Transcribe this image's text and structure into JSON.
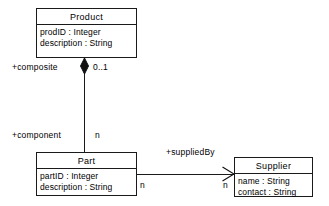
{
  "diagram": {
    "type": "uml-class-diagram",
    "background_color": "#ffffff",
    "line_color": "#1a1a1a"
  },
  "classes": [
    {
      "id": "product",
      "name": "Product",
      "attributes": [
        "prodID : Integer",
        "description : String"
      ]
    },
    {
      "id": "part",
      "name": "Part",
      "attributes": [
        "partID : Integer",
        "description : String"
      ]
    },
    {
      "id": "supplier",
      "name": "Supplier",
      "attributes": [
        "name : String",
        "contact : String"
      ]
    }
  ],
  "relationships": [
    {
      "id": "composition",
      "kind": "composition",
      "from": "Product",
      "to": "Part",
      "source_role": "+composite",
      "source_multiplicity": "0..1",
      "target_role": "+component",
      "target_multiplicity": "n",
      "decoration": "filled-diamond"
    },
    {
      "id": "association",
      "kind": "association",
      "from": "Part",
      "to": "Supplier",
      "label": "+suppliedBy",
      "source_multiplicity": "n",
      "target_multiplicity": "n",
      "decoration": "open-arrow"
    }
  ],
  "labels": {
    "composite_role": "+composite",
    "composite_multiplicity": "0..1",
    "component_role": "+component",
    "component_multiplicity": "n",
    "suppliedby_label": "+suppliedBy",
    "part_end_multiplicity": "n",
    "supplier_end_multiplicity": "n"
  }
}
